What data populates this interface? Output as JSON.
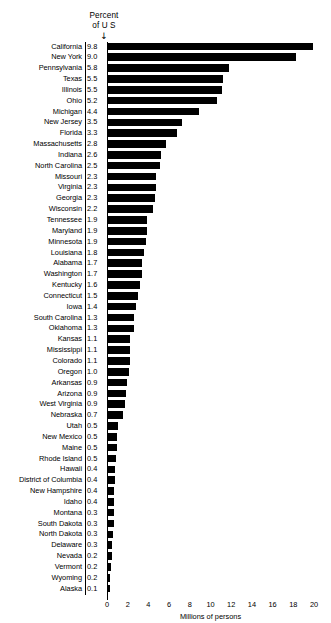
{
  "header": {
    "line1": "Percent",
    "line2": "of U S",
    "arrow_icon": "down-arrow-icon",
    "arrow_glyph": "↓"
  },
  "axis": {
    "title": "Millions of persons",
    "tick_labels": [
      "0",
      "2",
      "4",
      "6",
      "8",
      "10",
      "12",
      "14",
      "16",
      "18",
      "20"
    ],
    "tick_values": [
      0,
      2,
      4,
      6,
      8,
      10,
      12,
      14,
      16,
      18,
      20
    ],
    "minor_step": 1
  },
  "chart_data": {
    "type": "bar",
    "orientation": "horizontal",
    "title": "",
    "subtitle": "",
    "xlabel": "Millions of persons",
    "ylabel": "",
    "xlim": [
      0,
      20
    ],
    "grid": true,
    "legend": "none",
    "value_column_header": "Percent of U S",
    "categories": [
      "California",
      "New York",
      "Pennsylvania",
      "Texas",
      "Illinois",
      "Ohio",
      "Michigan",
      "New Jersey",
      "Florida",
      "Massachusetts",
      "Indiana",
      "North Carolina",
      "Missouri",
      "Virginia",
      "Georgia",
      "Wisconsin",
      "Tennessee",
      "Maryland",
      "Minnesota",
      "Louisiana",
      "Alabama",
      "Washington",
      "Kentucky",
      "Connecticut",
      "Iowa",
      "South Carolina",
      "Oklahoma",
      "Kansas",
      "Mississippi",
      "Colorado",
      "Oregon",
      "Arkansas",
      "Arizona",
      "West Virginia",
      "Nebraska",
      "Utah",
      "New Mexico",
      "Maine",
      "Rhode Island",
      "Hawaii",
      "District of Columbia",
      "New Hampshire",
      "Idaho",
      "Montana",
      "South Dakota",
      "North Dakota",
      "Delaware",
      "Nevada",
      "Vermont",
      "Wyoming",
      "Alaska"
    ],
    "percent_of_us": [
      "9.8",
      "9.0",
      "5.8",
      "5.5",
      "5.5",
      "5.2",
      "4.4",
      "3.5",
      "3.3",
      "2.8",
      "2.6",
      "2.5",
      "2.3",
      "2.3",
      "2.3",
      "2.2",
      "1.9",
      "1.9",
      "1.9",
      "1.8",
      "1.7",
      "1.7",
      "1.6",
      "1.5",
      "1.4",
      "1.3",
      "1.3",
      "1.1",
      "1.1",
      "1.1",
      "1.0",
      "0.9",
      "0.9",
      "0.9",
      "0.7",
      "0.5",
      "0.5",
      "0.5",
      "0.5",
      "0.4",
      "0.4",
      "0.4",
      "0.4",
      "0.3",
      "0.3",
      "0.3",
      "0.3",
      "0.2",
      "0.2",
      "0.2",
      "0.1"
    ],
    "values": [
      19.9,
      18.3,
      11.8,
      11.2,
      11.1,
      10.6,
      8.9,
      7.2,
      6.8,
      5.7,
      5.2,
      5.1,
      4.7,
      4.7,
      4.6,
      4.4,
      3.9,
      3.9,
      3.8,
      3.6,
      3.4,
      3.4,
      3.2,
      3.0,
      2.8,
      2.6,
      2.6,
      2.2,
      2.2,
      2.2,
      2.1,
      1.9,
      1.8,
      1.7,
      1.5,
      1.1,
      1.0,
      1.0,
      0.9,
      0.8,
      0.8,
      0.7,
      0.7,
      0.7,
      0.7,
      0.6,
      0.5,
      0.5,
      0.4,
      0.3,
      0.3
    ]
  }
}
